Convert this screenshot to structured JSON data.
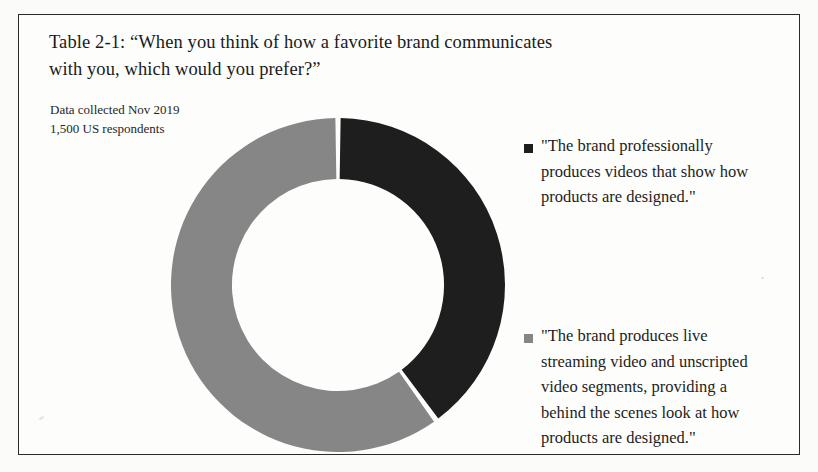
{
  "figure": {
    "title_lines": [
      "Table 2-1: “When you think of how a favorite brand communicates",
      "with you, which would you prefer?”"
    ],
    "note_lines": [
      "Data collected Nov 2019",
      "1,500 US respondents"
    ]
  },
  "colors": {
    "dark": "#1e1e1e",
    "gray": "#868686",
    "background": "#fdfdfc",
    "frame": "#2a2a2a",
    "text": "#1a1a1a"
  },
  "legend": {
    "items": [
      {
        "marker": "square-marker-dark",
        "color": "#1e1e1e",
        "lines": [
          "\"The brand professionally",
          "produces videos that show how",
          "products are designed.\""
        ]
      },
      {
        "marker": "square-marker-gray",
        "color": "#868686",
        "lines": [
          "\"The brand produces live",
          "streaming video and unscripted",
          "video segments, providing a",
          "behind the scenes look at how",
          "products are designed.\""
        ]
      }
    ]
  },
  "chart_data": {
    "type": "pie",
    "title": "Table 2-1: “When you think of how a favorite brand communicates with you, which would you prefer?”",
    "variant": "donut",
    "start_angle_deg": 0,
    "direction": "clockwise",
    "hole_ratio": 0.635,
    "labels": [
      "\"The brand professionally produces videos that show how products are designed.\"",
      "\"The brand produces live streaming video and unscripted video segments, providing a behind the scenes look at how products are designed.\""
    ],
    "values": [
      40,
      60
    ],
    "value_unit": "percent",
    "angles_deg": [
      144,
      216
    ],
    "slice_colors": [
      "#1e1e1e",
      "#868686"
    ],
    "legend_position": "right",
    "grid": false,
    "xlabel": "",
    "ylabel": "",
    "annotation": "Data collected Nov 2019 / 1,500 US respondents"
  }
}
